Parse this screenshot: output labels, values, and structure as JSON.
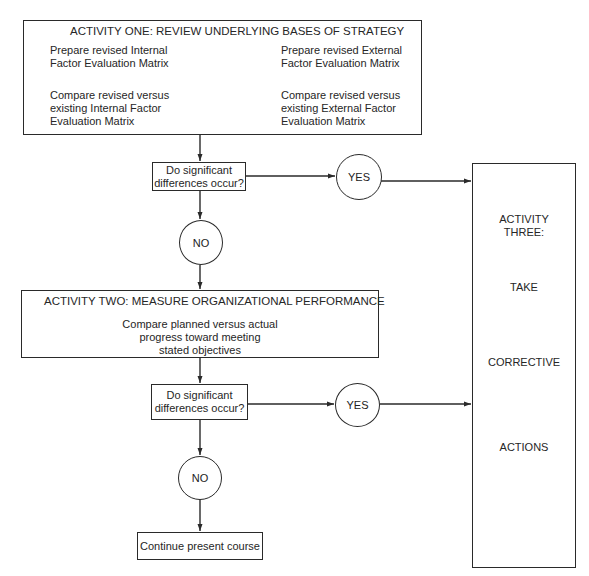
{
  "activity_one": {
    "title": "ACTIVITY ONE:  REVIEW UNDERLYING BASES OF STRATEGY",
    "left_top": [
      "Prepare revised Internal",
      "Factor Evaluation Matrix"
    ],
    "right_top": [
      "Prepare revised External",
      "Factor Evaluation Matrix"
    ],
    "left_bottom": [
      "Compare revised versus",
      "existing Internal Factor",
      "Evaluation Matrix"
    ],
    "right_bottom": [
      "Compare revised versus",
      "existing External Factor",
      "Evaluation Matrix"
    ]
  },
  "decision_one": {
    "lines": [
      "Do significant",
      "differences occur?"
    ]
  },
  "yes_one": {
    "label": "YES"
  },
  "no_one": {
    "label": "NO"
  },
  "activity_two": {
    "title": "ACTIVITY TWO:  MEASURE ORGANIZATIONAL PERFORMANCE",
    "body": [
      "Compare planned versus actual",
      "progress toward meeting",
      "stated objectives"
    ]
  },
  "decision_two": {
    "lines": [
      "Do significant",
      "differences occur?"
    ]
  },
  "yes_two": {
    "label": "YES"
  },
  "no_two": {
    "label": "NO"
  },
  "continue_box": {
    "label": "Continue present course"
  },
  "activity_three": {
    "heading": [
      "ACTIVITY",
      "THREE:"
    ],
    "take": "TAKE",
    "corrective": "CORRECTIVE",
    "actions": "ACTIONS"
  },
  "colors": {
    "line": "#2a2a2a",
    "text": "#262626",
    "background": "#ffffff"
  }
}
